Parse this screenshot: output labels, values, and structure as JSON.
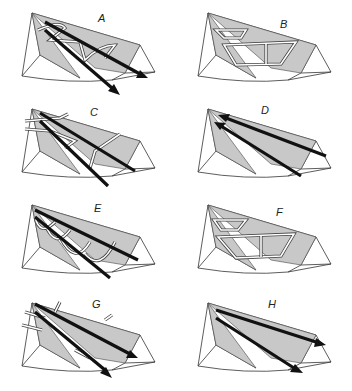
{
  "figure": {
    "panels": [
      {
        "id": "A",
        "label": "A",
        "x": 0,
        "y": 0,
        "features": [
          "shaded face",
          "looped channels",
          "two long arrows"
        ]
      },
      {
        "id": "B",
        "label": "B",
        "x": 176,
        "y": 0,
        "features": [
          "shaded face",
          "closed channel network"
        ]
      },
      {
        "id": "C",
        "label": "C",
        "x": 0,
        "y": 96,
        "features": [
          "shaded face",
          "branching channels",
          "two long arrows"
        ]
      },
      {
        "id": "D",
        "label": "D",
        "x": 176,
        "y": 96,
        "features": [
          "shaded face",
          "two long arrows pointing to apex"
        ]
      },
      {
        "id": "E",
        "label": "E",
        "x": 0,
        "y": 192,
        "features": [
          "shaded face",
          "U-shaped channels",
          "two long arrows"
        ]
      },
      {
        "id": "F",
        "label": "F",
        "x": 176,
        "y": 192,
        "features": [
          "shaded face",
          "closed channel network"
        ]
      },
      {
        "id": "G",
        "label": "G",
        "x": 0,
        "y": 290,
        "features": [
          "shaded face",
          "crossing channels",
          "two long arrows"
        ]
      },
      {
        "id": "H",
        "label": "H",
        "x": 176,
        "y": 290,
        "features": [
          "shaded face",
          "two long arrows pointing away from apex"
        ]
      }
    ]
  },
  "colors": {
    "background": "#ffffff",
    "shade": "#c8c8c8",
    "line": "#333333",
    "arrow": "#111111"
  }
}
